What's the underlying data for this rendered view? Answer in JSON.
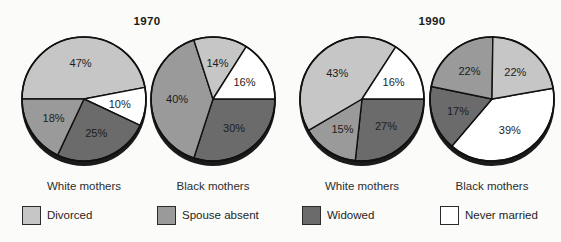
{
  "figure_title": "Marital status of single mothers, 1970 and 1990",
  "year_titles": {
    "left": "1970",
    "right": "1990"
  },
  "category_colors": {
    "Divorced": "#c6c6c6",
    "Spouse absent": "#9a9a9a",
    "Widowed": "#6b6b6b",
    "Never married": "#ffffff"
  },
  "style_colors": {
    "slice_stroke": "#111111",
    "shadow": "#1b1b1b",
    "label_text": "#1c1c1c"
  },
  "legend": {
    "items": [
      {
        "label": "Divorced",
        "color": "#c6c6c6"
      },
      {
        "label": "Spouse absent",
        "color": "#9a9a9a"
      },
      {
        "label": "Widowed",
        "color": "#6b6b6b"
      },
      {
        "label": "Never married",
        "color": "#ffffff"
      }
    ]
  },
  "chart_data": [
    {
      "type": "pie",
      "group": "1970",
      "title": "White mothers",
      "start_angle": 180,
      "clockwise": true,
      "slices": [
        {
          "label": "Divorced",
          "value": 47
        },
        {
          "label": "Never married",
          "value": 10
        },
        {
          "label": "Widowed",
          "value": 25
        },
        {
          "label": "Spouse absent",
          "value": 18
        }
      ]
    },
    {
      "type": "pie",
      "group": "1970",
      "title": "Black mothers",
      "start_angle": 0,
      "clockwise": true,
      "slices": [
        {
          "label": "Widowed",
          "value": 30
        },
        {
          "label": "Spouse absent",
          "value": 40
        },
        {
          "label": "Divorced",
          "value": 14
        },
        {
          "label": "Never married",
          "value": 16
        }
      ]
    },
    {
      "type": "pie",
      "group": "1990",
      "title": "White mothers",
      "start_angle": 0,
      "clockwise": true,
      "slices": [
        {
          "label": "Widowed",
          "value": 27
        },
        {
          "label": "Spouse absent",
          "value": 15
        },
        {
          "label": "Divorced",
          "value": 43
        },
        {
          "label": "Never married",
          "value": 16
        }
      ]
    },
    {
      "type": "pie",
      "group": "1990",
      "title": "Black mothers",
      "start_angle": 10,
      "clockwise": true,
      "slices": [
        {
          "label": "Never married",
          "value": 39
        },
        {
          "label": "Widowed",
          "value": 17
        },
        {
          "label": "Spouse absent",
          "value": 22
        },
        {
          "label": "Divorced",
          "value": 22
        }
      ]
    }
  ]
}
